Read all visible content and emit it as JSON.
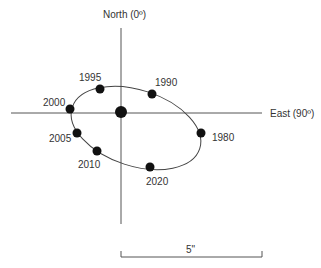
{
  "diagram": {
    "axes": {
      "north_label": "North (0º)",
      "east_label": "East (90º)"
    },
    "scale_bar": {
      "label": "5\""
    },
    "center_point": {
      "x": 121,
      "y": 112
    },
    "orbit_points": [
      {
        "year": "1980",
        "x": 201,
        "y": 133,
        "label_x": 212,
        "label_y": 141
      },
      {
        "year": "1990",
        "x": 152,
        "y": 94,
        "label_x": 155,
        "label_y": 86
      },
      {
        "year": "1995",
        "x": 100,
        "y": 89,
        "label_x": 79,
        "label_y": 81
      },
      {
        "year": "2000",
        "x": 70,
        "y": 109,
        "label_x": 43,
        "label_y": 106
      },
      {
        "year": "2005",
        "x": 77,
        "y": 133,
        "label_x": 49,
        "label_y": 142
      },
      {
        "year": "2010",
        "x": 97,
        "y": 151,
        "label_x": 78,
        "label_y": 168
      },
      {
        "year": "2020",
        "x": 150,
        "y": 167,
        "label_x": 146,
        "label_y": 185
      }
    ]
  }
}
